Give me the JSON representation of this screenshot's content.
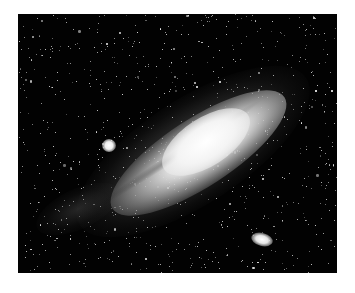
{
  "image": {
    "subject": "Andromeda galaxy with satellite galaxies",
    "colors": {
      "background": "#ffffff",
      "sky": "#020202",
      "core": "#f4f4f4",
      "star": "#ffffff"
    },
    "frame": {
      "x": 18,
      "y": 14,
      "width": 319,
      "height": 259
    }
  }
}
